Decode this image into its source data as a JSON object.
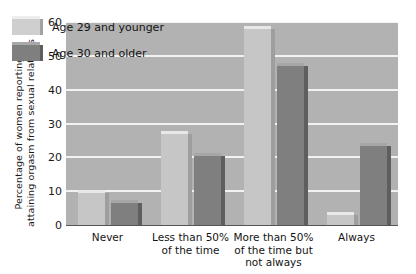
{
  "chart_data": {
    "type": "bar",
    "title": "",
    "xlabel": "",
    "ylabel": "Percentage of women reporting attaining orgasm from sexual relations",
    "ylabel_lines": [
      "Percentage of women reporting",
      "attaining orgasm from sexual relations"
    ],
    "ylim": [
      0,
      60
    ],
    "ytick_values": [
      0,
      10,
      20,
      30,
      40,
      50,
      60
    ],
    "ytick_labels": [
      "0",
      "10",
      "20",
      "30",
      "40",
      "50",
      "60"
    ],
    "grid": true,
    "grid_axis": "y",
    "legend_position": "upper left inside plot",
    "categories": [
      "Never",
      "Less than 50% of the time",
      "More than 50% of the time but not always",
      "Always"
    ],
    "category_label_lines": [
      [
        "Never"
      ],
      [
        "Less than 50%",
        "of the time"
      ],
      [
        "More than 50%",
        "of the time but",
        "not always"
      ],
      [
        "Always"
      ]
    ],
    "series": [
      {
        "name": "Age 29 and younger",
        "color": "#c6c6c6",
        "values": [
          9.5,
          27,
          58,
          3
        ]
      },
      {
        "name": "Age 30 and older",
        "color": "#7f7f7f",
        "values": [
          6.5,
          20.5,
          47,
          23.5
        ]
      }
    ]
  },
  "legend": {
    "items": [
      {
        "label": "Age 29 and younger",
        "swatch": "light-gray-swatch"
      },
      {
        "label": "Age 30 and older",
        "swatch": "dark-gray-swatch"
      }
    ]
  },
  "colors": {
    "plot_background": "#b2b2b2",
    "gridline": "#f2f2f2",
    "page_background": "#ffffff",
    "series_light": "#c6c6c6",
    "series_dark": "#7f7f7f",
    "text": "#141414"
  }
}
